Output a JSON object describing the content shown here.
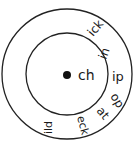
{
  "diagram": {
    "type": "word-wheel",
    "center_label": "ch",
    "endings": [
      "ick",
      "in",
      "ip",
      "op",
      "at",
      "eck",
      "ild"
    ],
    "colors": {
      "stroke": "#222222",
      "background": "#ffffff"
    }
  }
}
